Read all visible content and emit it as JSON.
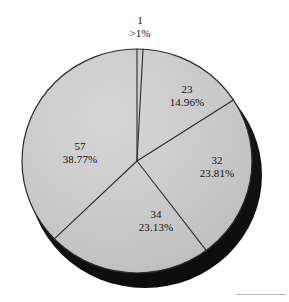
{
  "chart_data": {
    "type": "pie",
    "title": "",
    "subtitle": "",
    "xlabel": "",
    "ylabel": "",
    "grid": false,
    "legend": "none",
    "style": "3d-shaded",
    "total": 147,
    "categories": [
      "1",
      "23",
      "32",
      "34",
      "57"
    ],
    "values": [
      1,
      22,
      35,
      34,
      57
    ],
    "labels": [
      "1",
      "23",
      "32",
      "34",
      "57"
    ],
    "percent_labels": [
      ">1%",
      "14.96%",
      "23.81%",
      "23.13%",
      "38.77%"
    ],
    "percent_values": [
      0.68,
      14.96,
      23.81,
      23.13,
      38.77
    ],
    "slices": [
      {
        "name": "1",
        "label": "1",
        "percent_label": ">1%",
        "percent_value": 0.68,
        "start_angle_deg": 0,
        "end_angle_deg": 3,
        "label_position": "outside-top"
      },
      {
        "name": "23",
        "label": "23",
        "percent_label": "14.96%",
        "percent_value": 14.96,
        "start_angle_deg": 3,
        "end_angle_deg": 57,
        "label_position": "inside-upper-right"
      },
      {
        "name": "32",
        "label": "32",
        "percent_label": "23.81%",
        "percent_value": 23.81,
        "start_angle_deg": 57,
        "end_angle_deg": 143,
        "label_position": "inside-right"
      },
      {
        "name": "34",
        "label": "34",
        "percent_label": "23.13%",
        "percent_value": 23.13,
        "start_angle_deg": 143,
        "end_angle_deg": 226,
        "label_position": "inside-bottom"
      },
      {
        "name": "57",
        "label": "57",
        "percent_label": "38.77%",
        "percent_value": 38.77,
        "start_angle_deg": 226,
        "end_angle_deg": 360,
        "label_position": "inside-left"
      }
    ],
    "colors": {
      "slice_fill": "#c9c9c9",
      "slice_fill_light": "#d2d2d2",
      "slice_fill_dark": "#bdbdbd",
      "slice_outline": "#2b2b2b",
      "shadow_3d": "#171717",
      "label_text": "#111111",
      "background": "#ffffff"
    }
  },
  "geometry": {
    "center_x": 137,
    "center_y": 161,
    "radius_x": 115,
    "radius_y": 112,
    "depth_offset_x": 8,
    "depth_offset_y": 14
  }
}
